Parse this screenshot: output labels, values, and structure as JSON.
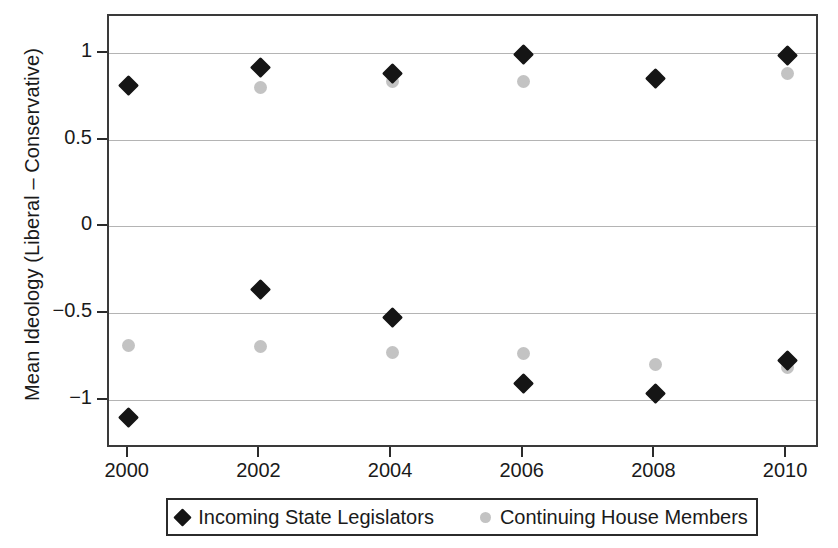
{
  "chart_data": {
    "type": "scatter",
    "title": "",
    "xlabel": "",
    "ylabel": "Mean Ideology (Liberal – Conservative)",
    "x": [
      2000,
      2002,
      2004,
      2006,
      2008,
      2010
    ],
    "xtick_labels": [
      "2000",
      "2002",
      "2004",
      "2006",
      "2008",
      "2010"
    ],
    "xlim": [
      1999.7,
      2010.5
    ],
    "ylim": [
      -1.28,
      1.22
    ],
    "ytick_labels": [
      "1",
      "0.5",
      "0",
      "-0.5",
      "-1"
    ],
    "ytick_values": [
      1,
      0.5,
      0,
      -0.5,
      -1
    ],
    "grid": true,
    "legend_position": "bottom-center",
    "series": [
      {
        "name": "Incoming State Legislators",
        "marker": "diamond",
        "color": "#151515",
        "groups": [
          {
            "label": "upper",
            "values": [
              0.82,
              0.92,
              0.89,
              1.0,
              0.86,
              0.99
            ]
          },
          {
            "label": "lower",
            "values": [
              -1.1,
              -0.36,
              -0.52,
              -0.9,
              -0.96,
              -0.77
            ]
          }
        ]
      },
      {
        "name": "Continuing House Members",
        "marker": "circle",
        "color": "#c3c3c3",
        "groups": [
          {
            "label": "upper",
            "values": [
              0.82,
              0.81,
              0.84,
              0.84,
              0.87,
              0.89
            ]
          },
          {
            "label": "lower",
            "values": [
              -0.68,
              -0.69,
              -0.72,
              -0.73,
              -0.79,
              -0.81
            ]
          }
        ]
      }
    ]
  },
  "legend": {
    "entries": [
      {
        "label": "Incoming State Legislators",
        "marker": "diamond"
      },
      {
        "label": "Continuing House Members",
        "marker": "circle"
      }
    ]
  }
}
